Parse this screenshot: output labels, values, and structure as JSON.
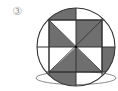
{
  "figure": {
    "label": "③",
    "colors": {
      "shade": "#6f6f6f",
      "stroke": "#333333",
      "ellipse_stroke": "#8a8a8a",
      "background": "#ffffff"
    },
    "circle": {
      "cx": 76,
      "cy": 47,
      "r": 39
    },
    "square": {
      "x1": 49,
      "y1": 20,
      "x2": 102,
      "y2": 72
    },
    "ellipse": {
      "cx": 76,
      "cy": 78,
      "rx": 40,
      "ry": 6.5
    },
    "shaded_regions": [
      "square-top-left-lower-triangle",
      "square-top-right-quadrant",
      "square-bottom-left-right-triangle",
      "square-bottom-right-left-triangle",
      "circle-top-left-segment",
      "circle-right-lower-segment",
      "circle-bottom-left-segment"
    ]
  }
}
